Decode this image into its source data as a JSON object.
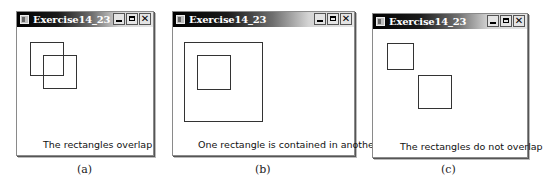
{
  "windows": [
    {
      "id": "a",
      "title": "Exercise14_23",
      "message": "The rectangles overlap",
      "caption": "(a)",
      "controls": {
        "minimize": "minimize-icon",
        "maximize": "maximize-icon",
        "close": "✕"
      },
      "rectangles": [
        {
          "x": 30,
          "y": 42,
          "w": 34,
          "h": 34
        },
        {
          "x": 43,
          "y": 55,
          "w": 34,
          "h": 34
        }
      ]
    },
    {
      "id": "b",
      "title": "Exercise14_23",
      "message": "One rectangle is contained in another",
      "caption": "(b)",
      "controls": {
        "minimize": "minimize-icon",
        "maximize": "maximize-icon",
        "close": "✕"
      },
      "rectangles": [
        {
          "x": 184,
          "y": 42,
          "w": 79,
          "h": 80
        },
        {
          "x": 197,
          "y": 55,
          "w": 34,
          "h": 35
        }
      ]
    },
    {
      "id": "c",
      "title": "Exercise14_23",
      "message": "The rectangles do not overlap",
      "caption": "(c)",
      "controls": {
        "minimize": "minimize-icon",
        "maximize": "maximize-icon",
        "close": "✕"
      },
      "rectangles": [
        {
          "x": 387,
          "y": 43,
          "w": 27,
          "h": 27
        },
        {
          "x": 418,
          "y": 75,
          "w": 34,
          "h": 34
        }
      ]
    }
  ]
}
